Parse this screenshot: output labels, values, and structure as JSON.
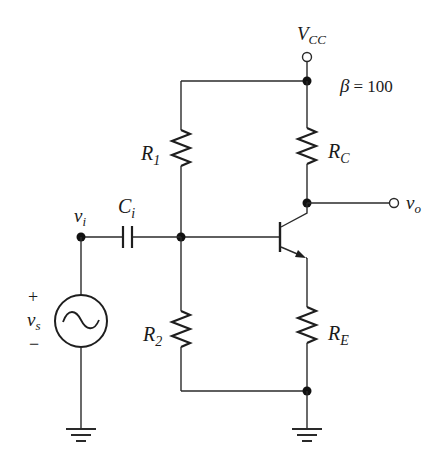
{
  "diagram": {
    "type": "circuit-schematic",
    "supply": {
      "label": "V",
      "sub": "CC"
    },
    "beta": {
      "symbol": "β",
      "eq": "= 100"
    },
    "components": {
      "R1": {
        "label": "R",
        "sub": "1"
      },
      "R2": {
        "label": "R",
        "sub": "2"
      },
      "RC": {
        "label": "R",
        "sub": "C"
      },
      "RE": {
        "label": "R",
        "sub": "E"
      },
      "Ci": {
        "label": "C",
        "sub": "i"
      },
      "source": {
        "label": "v",
        "sub": "s",
        "plus": "+",
        "minus": "−"
      }
    },
    "nodes": {
      "input": {
        "label": "v",
        "sub": "i"
      },
      "output": {
        "label": "v",
        "sub": "o"
      }
    },
    "transistor": {
      "kind": "NPN BJT"
    },
    "colors": {
      "wire": "#2a2a2a",
      "background": "#ffffff"
    }
  }
}
